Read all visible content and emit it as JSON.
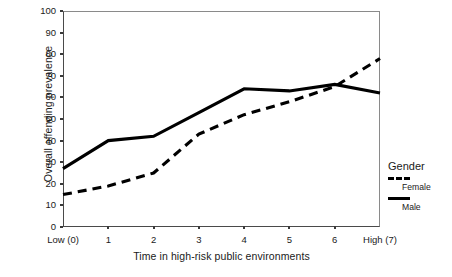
{
  "chart_data": {
    "type": "line",
    "title": "",
    "xlabel": "Time in high-risk public environments",
    "ylabel": "Overall offending prevalence",
    "x": [
      0,
      1,
      2,
      3,
      4,
      5,
      6,
      7
    ],
    "categories": [
      "Low (0)",
      "1",
      "2",
      "3",
      "4",
      "5",
      "6",
      "High (7)"
    ],
    "ylim": [
      0,
      100
    ],
    "yticks": [
      0,
      10,
      20,
      30,
      40,
      50,
      60,
      70,
      80,
      90,
      100
    ],
    "grid": false,
    "legend_position": "right",
    "legend_title": "Gender",
    "series": [
      {
        "name": "Female",
        "style": "dashed",
        "color": "#000000",
        "values": [
          15,
          19,
          25,
          43,
          52,
          58,
          65,
          78
        ]
      },
      {
        "name": "Male",
        "style": "solid",
        "color": "#000000",
        "values": [
          27,
          40,
          42,
          53,
          64,
          63,
          66,
          62
        ]
      }
    ]
  },
  "axes": {
    "y_title": "Overall offending prevalence",
    "x_title": "Time in high-risk public environments",
    "y_tick_labels": [
      "100",
      "90",
      "80",
      "70",
      "60",
      "50",
      "40",
      "30",
      "20",
      "10",
      "0"
    ],
    "x_tick_labels": [
      "Low (0)",
      "1",
      "2",
      "3",
      "4",
      "5",
      "6",
      "High (7)"
    ]
  },
  "legend": {
    "title": "Gender",
    "entries": [
      {
        "label": "Female",
        "style": "dashed"
      },
      {
        "label": "Male",
        "style": "solid"
      }
    ]
  }
}
